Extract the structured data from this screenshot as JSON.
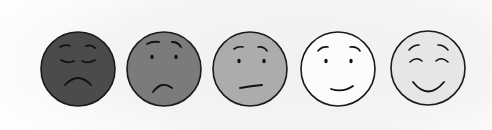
{
  "scale": {
    "label": "Pain / mood face scale",
    "faces": [
      {
        "id": "very-sad",
        "expression": "very sad",
        "cx": 78,
        "cy": 69,
        "r": 37,
        "fill": "#4b4b4b"
      },
      {
        "id": "sad",
        "expression": "sad",
        "cx": 164,
        "cy": 69,
        "r": 37,
        "fill": "#7b7b7b"
      },
      {
        "id": "neutral",
        "expression": "neutral",
        "cx": 250,
        "cy": 69,
        "r": 37,
        "fill": "#acacac"
      },
      {
        "id": "happy",
        "expression": "happy",
        "cx": 338,
        "cy": 69,
        "r": 37,
        "fill": "#fcfcfc"
      },
      {
        "id": "very-happy",
        "expression": "very happy",
        "cx": 428,
        "cy": 68,
        "r": 37,
        "fill": "#e6e6e6"
      }
    ],
    "stroke_color": "#1a1a1a",
    "background_color": "#ffffff"
  }
}
